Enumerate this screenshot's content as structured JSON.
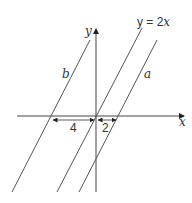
{
  "diagram": {
    "axes": {
      "x_label": "x",
      "y_label": "y"
    },
    "lines": [
      {
        "name": "b",
        "label": "b",
        "x_intercept": -4
      },
      {
        "name": "y=2x",
        "label": "y = 2x",
        "x_intercept": 0
      },
      {
        "name": "a",
        "label": "a",
        "x_intercept": 2
      }
    ],
    "measurements": [
      {
        "label": "4",
        "from": "b",
        "to": "origin"
      },
      {
        "label": "2",
        "from": "origin",
        "to": "a"
      }
    ],
    "colors": {
      "stroke": "#444444",
      "background": "#ffffff"
    }
  }
}
